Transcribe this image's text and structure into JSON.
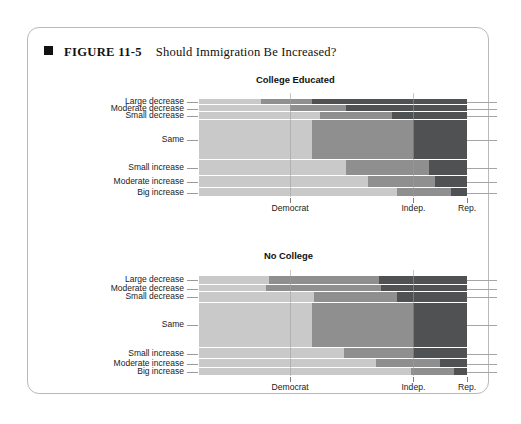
{
  "figure": {
    "marker": "black-square",
    "number_label": "FIGURE 11-5",
    "title": "Should Immigration Be Increased?"
  },
  "colors": {
    "democrat": "#c9c9c9",
    "independent": "#8f8f8f",
    "republican": "#4f5153",
    "gridline": "#9d9d9d",
    "axis_text": "#1a1a1a",
    "card_border": "#b9b9b9"
  },
  "axis": {
    "x_tick_labels": [
      "Democrat",
      "Indep.",
      "Rep."
    ],
    "x_tick_positions_pct": [
      34.0,
      80.0,
      100.0
    ],
    "y_categories": [
      "Large decrease",
      "Moderate decrease",
      "Small decrease",
      "Same",
      "Small increase",
      "Moderate increase",
      "Big increase"
    ]
  },
  "chart_data": {
    "type": "bar",
    "subtype": "spine-plot / mosaic (stacked 100% horizontal bars, row height = category share)",
    "title": "Should Immigration Be Increased?",
    "xlabel": "",
    "ylabel": "",
    "xlim": [
      0,
      100
    ],
    "grid": true,
    "legend": "none (x-axis tick labels identify party groups)",
    "series": [
      {
        "name": "Democrat",
        "color": "#c9c9c9"
      },
      {
        "name": "Indep.",
        "color": "#8f8f8f"
      },
      {
        "name": "Rep.",
        "color": "#4f5153"
      }
    ],
    "categories": [
      "Large decrease",
      "Moderate decrease",
      "Small decrease",
      "Same",
      "Small increase",
      "Moderate increase",
      "Big increase"
    ],
    "panels": [
      {
        "title": "College Educated",
        "rows": [
          {
            "category": "Large decrease",
            "height_pct": 5.5,
            "values": {
              "Democrat": 23.0,
              "Indep.": 19.0,
              "Rep.": 58.0
            }
          },
          {
            "category": "Moderate decrease",
            "height_pct": 6.0,
            "values": {
              "Democrat": 34.0,
              "Indep.": 21.0,
              "Rep.": 45.0
            }
          },
          {
            "category": "Small decrease",
            "height_pct": 7.0,
            "values": {
              "Democrat": 45.0,
              "Indep.": 27.0,
              "Rep.": 28.0
            }
          },
          {
            "category": "Same",
            "height_pct": 35.0,
            "values": {
              "Democrat": 42.0,
              "Indep.": 38.0,
              "Rep.": 20.0
            }
          },
          {
            "category": "Small increase",
            "height_pct": 14.0,
            "values": {
              "Democrat": 55.0,
              "Indep.": 31.0,
              "Rep.": 14.0
            }
          },
          {
            "category": "Moderate increase",
            "height_pct": 11.0,
            "values": {
              "Democrat": 63.0,
              "Indep.": 25.0,
              "Rep.": 12.0
            }
          },
          {
            "category": "Big increase",
            "height_pct": 7.5,
            "values": {
              "Democrat": 74.0,
              "Indep.": 20.0,
              "Rep.": 6.0
            }
          }
        ]
      },
      {
        "title": "No College",
        "rows": [
          {
            "category": "Large decrease",
            "height_pct": 7.0,
            "values": {
              "Democrat": 26.0,
              "Indep.": 41.0,
              "Rep.": 33.0
            }
          },
          {
            "category": "Moderate decrease",
            "height_pct": 5.5,
            "values": {
              "Democrat": 25.0,
              "Indep.": 43.0,
              "Rep.": 32.0
            }
          },
          {
            "category": "Small decrease",
            "height_pct": 8.5,
            "values": {
              "Democrat": 43.0,
              "Indep.": 31.0,
              "Rep.": 26.0
            }
          },
          {
            "category": "Same",
            "height_pct": 35.0,
            "values": {
              "Democrat": 42.0,
              "Indep.": 38.0,
              "Rep.": 20.0
            }
          },
          {
            "category": "Small increase",
            "height_pct": 9.0,
            "values": {
              "Democrat": 54.0,
              "Indep.": 26.0,
              "Rep.": 20.0
            }
          },
          {
            "category": "Moderate increase",
            "height_pct": 7.0,
            "values": {
              "Democrat": 66.0,
              "Indep.": 24.0,
              "Rep.": 10.0
            }
          },
          {
            "category": "Big increase",
            "height_pct": 6.0,
            "values": {
              "Democrat": 79.0,
              "Indep.": 16.0,
              "Rep.": 5.0
            }
          }
        ]
      }
    ]
  }
}
